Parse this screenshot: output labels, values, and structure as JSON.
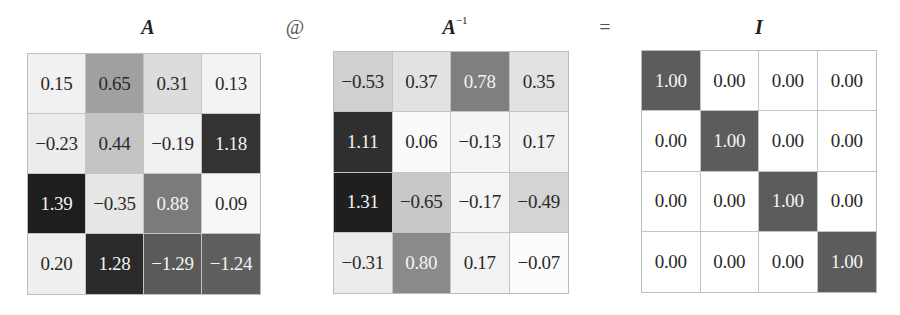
{
  "operators": {
    "matmul": "@",
    "equals": "="
  },
  "matrices": [
    {
      "name": "A",
      "title": "A",
      "superscript": "",
      "values": [
        [
          "0.15",
          "0.65",
          "0.31",
          "0.13"
        ],
        [
          "−0.23",
          "0.44",
          "−0.19",
          "1.18"
        ],
        [
          "1.39",
          "−0.35",
          "0.88",
          "0.09"
        ],
        [
          "0.20",
          "1.28",
          "−1.29",
          "−1.24"
        ]
      ],
      "colors": [
        [
          "#f1f1f1",
          "#a0a0a0",
          "#dcdcdc",
          "#f3f3f3"
        ],
        [
          "#ececec",
          "#c4c4c4",
          "#f1f1f1",
          "#333333"
        ],
        [
          "#1e1e1e",
          "#e6e6e6",
          "#7b7b7b",
          "#f7f7f7"
        ],
        [
          "#efefef",
          "#2a2a2a",
          "#5a5a5a",
          "#5f5f5f"
        ]
      ]
    },
    {
      "name": "A_inverse",
      "title": "A",
      "superscript": "−1",
      "values": [
        [
          "−0.53",
          "0.37",
          "0.78",
          "0.35"
        ],
        [
          "1.11",
          "0.06",
          "−0.13",
          "0.17"
        ],
        [
          "1.31",
          "−0.65",
          "−0.17",
          "−0.49"
        ],
        [
          "−0.31",
          "0.80",
          "0.17",
          "−0.07"
        ]
      ],
      "colors": [
        [
          "#d0d0d0",
          "#e2e2e2",
          "#7f7f7f",
          "#e2e2e2"
        ],
        [
          "#2f2f2f",
          "#fafafa",
          "#f5f5f5",
          "#f1f1f1"
        ],
        [
          "#1f1f1f",
          "#c8c8c8",
          "#f4f4f4",
          "#d4d4d4"
        ],
        [
          "#ececec",
          "#8a8a8a",
          "#f3f3f3",
          "#fcfcfc"
        ]
      ]
    },
    {
      "name": "I",
      "title": "I",
      "superscript": "",
      "values": [
        [
          "1.00",
          "0.00",
          "0.00",
          "0.00"
        ],
        [
          "0.00",
          "1.00",
          "0.00",
          "0.00"
        ],
        [
          "0.00",
          "0.00",
          "1.00",
          "0.00"
        ],
        [
          "0.00",
          "0.00",
          "0.00",
          "1.00"
        ]
      ],
      "colors": [
        [
          "#5c5c5c",
          "#ffffff",
          "#ffffff",
          "#ffffff"
        ],
        [
          "#ffffff",
          "#5c5c5c",
          "#ffffff",
          "#ffffff"
        ],
        [
          "#ffffff",
          "#ffffff",
          "#5c5c5c",
          "#ffffff"
        ],
        [
          "#ffffff",
          "#ffffff",
          "#ffffff",
          "#5c5c5c"
        ]
      ]
    }
  ]
}
